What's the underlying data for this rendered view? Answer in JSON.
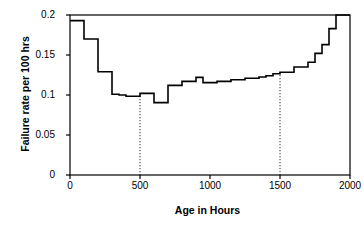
{
  "chart_data": {
    "type": "line",
    "subtype": "step",
    "title": "",
    "xlabel": "Age in Hours",
    "ylabel": "Failure rate per 100 hrs",
    "xlim": [
      0,
      2000
    ],
    "ylim": [
      0,
      0.2
    ],
    "xticks": [
      0,
      500,
      1000,
      1500,
      2000
    ],
    "xtick_labels": [
      "0",
      "500",
      "1000",
      "1500",
      "2000"
    ],
    "yticks": [
      0,
      0.05,
      0.1,
      0.15,
      0.2
    ],
    "ytick_labels": [
      "0",
      "0.05",
      "0.1",
      "0.15",
      "0.2"
    ],
    "grid": false,
    "legend": null,
    "series": [
      {
        "name": "Failure rate",
        "step_width": 50,
        "x": [
          0,
          50,
          100,
          150,
          200,
          250,
          300,
          350,
          400,
          450,
          500,
          550,
          600,
          650,
          700,
          750,
          800,
          850,
          900,
          950,
          1000,
          1050,
          1100,
          1150,
          1200,
          1250,
          1300,
          1350,
          1400,
          1450,
          1500,
          1550,
          1600,
          1650,
          1700,
          1750,
          1800,
          1850,
          1900,
          1950
        ],
        "values": [
          0.193,
          0.193,
          0.17,
          0.17,
          0.129,
          0.129,
          0.101,
          0.1,
          0.0985,
          0.0985,
          0.102,
          0.102,
          0.0905,
          0.0905,
          0.112,
          0.112,
          0.117,
          0.117,
          0.122,
          0.1155,
          0.1155,
          0.117,
          0.117,
          0.119,
          0.119,
          0.121,
          0.121,
          0.1225,
          0.124,
          0.1265,
          0.1285,
          0.1285,
          0.135,
          0.135,
          0.141,
          0.152,
          0.163,
          0.183,
          0.2,
          0.2
        ]
      }
    ],
    "annotations": [
      {
        "type": "vertical-dotted-line",
        "x": 500,
        "y_top": 0.0985,
        "y_bottom": 0
      },
      {
        "type": "vertical-dotted-line",
        "x": 1500,
        "y_top": 0.1285,
        "y_bottom": 0
      }
    ]
  },
  "axes": {
    "y_title": "Failure rate per 100 hrs",
    "x_title": "Age in Hours",
    "y_tick_labels": [
      "0.2",
      "0.15",
      "0.1",
      "0.05",
      "0"
    ],
    "x_tick_labels": [
      "0",
      "500",
      "1000",
      "1500",
      "2000"
    ]
  },
  "colors": {
    "line": "#000000",
    "axis": "#000000",
    "background": "#ffffff",
    "dotted": "#000000"
  }
}
